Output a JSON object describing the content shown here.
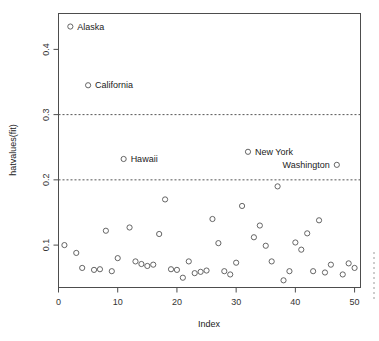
{
  "chart_data": {
    "type": "scatter",
    "title": "",
    "xlabel": "Index",
    "ylabel": "hatvalues(fit)",
    "xlim": [
      0,
      51
    ],
    "ylim": [
      0.035,
      0.455
    ],
    "xticks": [
      0,
      10,
      20,
      30,
      40,
      50
    ],
    "xtick_labels": [
      "0",
      "10",
      "20",
      "30",
      "40",
      "50"
    ],
    "yticks": [
      0.1,
      0.2,
      0.3,
      0.4
    ],
    "ytick_labels": [
      "0.1",
      "0.2",
      "0.3",
      "0.4"
    ],
    "grid": false,
    "legend": "none",
    "marker": "open-circle",
    "marker_color": "#555555",
    "reference_lines": [
      {
        "name": "cutoff-2p-over-n",
        "orientation": "horizontal",
        "value": 0.2,
        "style": "dashed"
      },
      {
        "name": "cutoff-3p-over-n",
        "orientation": "horizontal",
        "value": 0.3,
        "style": "dashed"
      }
    ],
    "x": [
      1,
      2,
      3,
      4,
      5,
      6,
      7,
      8,
      9,
      10,
      11,
      12,
      13,
      14,
      15,
      16,
      17,
      18,
      19,
      20,
      21,
      22,
      23,
      24,
      25,
      26,
      27,
      28,
      29,
      30,
      31,
      32,
      33,
      34,
      35,
      36,
      37,
      38,
      39,
      40,
      41,
      42,
      43,
      44,
      45,
      46,
      47,
      48,
      49,
      50
    ],
    "y": [
      0.1,
      0.435,
      0.088,
      0.065,
      0.345,
      0.062,
      0.063,
      0.122,
      0.06,
      0.08,
      0.232,
      0.127,
      0.075,
      0.071,
      0.068,
      0.07,
      0.117,
      0.17,
      0.063,
      0.062,
      0.05,
      0.075,
      0.057,
      0.059,
      0.061,
      0.14,
      0.103,
      0.06,
      0.055,
      0.073,
      0.16,
      0.243,
      0.112,
      0.13,
      0.099,
      0.075,
      0.19,
      0.046,
      0.06,
      0.104,
      0.093,
      0.118,
      0.06,
      0.138,
      0.058,
      0.07,
      0.223,
      0.055,
      0.072,
      0.065
    ],
    "labeled_points": [
      {
        "label": "Alaska",
        "x": 2,
        "y": 0.435,
        "anchor": "right"
      },
      {
        "label": "California",
        "x": 5,
        "y": 0.345,
        "anchor": "right"
      },
      {
        "label": "Hawaii",
        "x": 11,
        "y": 0.232,
        "anchor": "right"
      },
      {
        "label": "New York",
        "x": 32,
        "y": 0.243,
        "anchor": "right"
      },
      {
        "label": "Washington",
        "x": 47,
        "y": 0.223,
        "anchor": "left"
      }
    ]
  }
}
